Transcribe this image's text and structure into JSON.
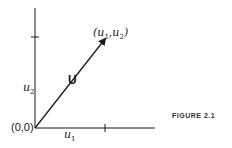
{
  "figure": {
    "caption": "FIGURE 2.1",
    "vector_label": "U",
    "endpoint_label": {
      "open": "(",
      "a": "u",
      "a_sub": "1",
      "sep": ",",
      "b": "u",
      "b_sub": "2",
      "close": ")"
    },
    "origin_label": "(0,0)",
    "x_component": {
      "base": "u",
      "sub": "1"
    },
    "y_component": {
      "base": "u",
      "sub": "2"
    }
  },
  "colors": {
    "ink": "#1a1a1a",
    "background": "#ffffff"
  }
}
